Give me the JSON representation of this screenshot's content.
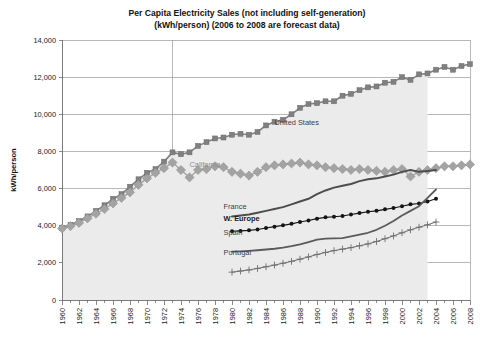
{
  "chart_data": {
    "type": "line",
    "title": "Per Capita Electricity Sales (not including self-generation)",
    "subtitle": "(kWh/person) (2006 to 2008 are forecast data)",
    "xlabel": "",
    "ylabel": "kWh/person",
    "ylim": [
      0,
      14000
    ],
    "ytick_step": 2000,
    "ytick_labels": [
      "0",
      "2,000",
      "4,000",
      "6,000",
      "8,000",
      "10,000",
      "12,000",
      "14,000"
    ],
    "ytick_values": [
      0,
      2000,
      4000,
      6000,
      8000,
      10000,
      12000,
      14000
    ],
    "xlim": [
      1960,
      2008
    ],
    "xtick_labels": [
      "1960",
      "1962",
      "1964",
      "1966",
      "1968",
      "1970",
      "1972",
      "1974",
      "1976",
      "1978",
      "1980",
      "1982",
      "1984",
      "1986",
      "1988",
      "1990",
      "1992",
      "1994",
      "1996",
      "1998",
      "2000",
      "2002",
      "2004",
      "2006",
      "2008"
    ],
    "xtick_values": [
      1960,
      1962,
      1964,
      1966,
      1968,
      1970,
      1972,
      1974,
      1976,
      1978,
      1980,
      1982,
      1984,
      1986,
      1988,
      1990,
      1992,
      1994,
      1996,
      1998,
      2000,
      2002,
      2004,
      2006,
      2008
    ],
    "xtick_minor_step": 1,
    "grid": "horizontal-major-plus-1973-vertical",
    "legend": "inline-labels-on-plot",
    "forecast_note": "2006 to 2008 are forecast data",
    "series": [
      {
        "name": "United States",
        "label": "United States",
        "color": "#808080",
        "marker": "square",
        "marker_size": 5,
        "line_width": 1.6,
        "fill": "#ebebeb",
        "fill_end_year": 2003,
        "label_x": 1985,
        "label_y": 9450,
        "label_style": "normal",
        "x": [
          1960,
          1961,
          1962,
          1963,
          1964,
          1965,
          1966,
          1967,
          1968,
          1969,
          1970,
          1971,
          1972,
          1973,
          1974,
          1975,
          1976,
          1977,
          1978,
          1979,
          1980,
          1981,
          1982,
          1983,
          1984,
          1985,
          1986,
          1987,
          1988,
          1989,
          1990,
          1991,
          1992,
          1993,
          1994,
          1995,
          1996,
          1997,
          1998,
          1999,
          2000,
          2001,
          2002,
          2003,
          2004,
          2005,
          2006,
          2007,
          2008
        ],
        "y": [
          3880,
          4050,
          4250,
          4500,
          4800,
          5100,
          5450,
          5700,
          6100,
          6500,
          6850,
          7050,
          7450,
          7950,
          7850,
          7950,
          8300,
          8500,
          8700,
          8750,
          8900,
          8950,
          8900,
          9050,
          9400,
          9600,
          9700,
          10000,
          10350,
          10550,
          10600,
          10700,
          10700,
          11000,
          11100,
          11300,
          11450,
          11500,
          11700,
          11750,
          12000,
          11850,
          12150,
          12200,
          12400,
          12550,
          12400,
          12600,
          12700
        ]
      },
      {
        "name": "California",
        "label": "California",
        "color": "#a3a3a3",
        "marker": "diamond",
        "marker_size": 4.6,
        "line_width": 1.4,
        "label_x": 1975,
        "label_y": 7150,
        "label_style": "light",
        "x": [
          1960,
          1961,
          1962,
          1963,
          1964,
          1965,
          1966,
          1967,
          1968,
          1969,
          1970,
          1971,
          1972,
          1973,
          1974,
          1975,
          1976,
          1977,
          1978,
          1979,
          1980,
          1981,
          1982,
          1983,
          1984,
          1985,
          1986,
          1987,
          1988,
          1989,
          1990,
          1991,
          1992,
          1993,
          1994,
          1995,
          1996,
          1997,
          1998,
          1999,
          2000,
          2001,
          2002,
          2003,
          2004,
          2005,
          2006,
          2007,
          2008
        ],
        "y": [
          3850,
          3980,
          4150,
          4400,
          4650,
          4900,
          5200,
          5500,
          5800,
          6200,
          6550,
          6850,
          7100,
          7400,
          7000,
          6600,
          7000,
          7050,
          7200,
          7150,
          6900,
          6800,
          6700,
          6900,
          7150,
          7250,
          7300,
          7350,
          7400,
          7300,
          7250,
          7150,
          7100,
          7050,
          7000,
          7050,
          7000,
          6950,
          6900,
          7000,
          7050,
          6650,
          6900,
          7000,
          7100,
          7200,
          7200,
          7250,
          7300
        ]
      },
      {
        "name": "France",
        "label": "France",
        "color": "#4d4d4d",
        "marker": "none",
        "marker_size": 0,
        "line_width": 2.0,
        "label_x": 1979,
        "label_y": 4900,
        "label_style": "normal",
        "x": [
          1980,
          1981,
          1982,
          1983,
          1984,
          1985,
          1986,
          1987,
          1988,
          1989,
          1990,
          1991,
          1992,
          1993,
          1994,
          1995,
          1996,
          1997,
          1998,
          1999,
          2000,
          2001,
          2002,
          2003,
          2004
        ],
        "y": [
          4500,
          4550,
          4600,
          4700,
          4800,
          4900,
          5000,
          5150,
          5300,
          5450,
          5700,
          5900,
          6050,
          6150,
          6250,
          6400,
          6500,
          6550,
          6650,
          6750,
          6900,
          7000,
          6900,
          6950,
          7000
        ]
      },
      {
        "name": "W. Europe",
        "label": "W. Europe",
        "color": "#141414",
        "marker": "circle",
        "marker_size": 3.0,
        "line_width": 1.1,
        "label_x": 1979,
        "label_y": 4250,
        "label_style": "bold",
        "x": [
          1980,
          1981,
          1982,
          1983,
          1984,
          1985,
          1986,
          1987,
          1988,
          1989,
          1990,
          1991,
          1992,
          1993,
          1994,
          1995,
          1996,
          1997,
          1998,
          1999,
          2000,
          2001,
          2002,
          2003,
          2004
        ],
        "y": [
          3700,
          3720,
          3750,
          3800,
          3880,
          3950,
          4020,
          4100,
          4200,
          4280,
          4380,
          4450,
          4480,
          4520,
          4600,
          4680,
          4750,
          4800,
          4880,
          4950,
          5050,
          5150,
          5200,
          5300,
          5450
        ]
      },
      {
        "name": "Spain",
        "label": "Spain",
        "color": "#5a5a5a",
        "marker": "none",
        "marker_size": 0,
        "line_width": 1.8,
        "label_x": 1979,
        "label_y": 3500,
        "label_style": "normal",
        "x": [
          1980,
          1981,
          1982,
          1983,
          1984,
          1985,
          1986,
          1987,
          1988,
          1989,
          1990,
          1991,
          1992,
          1993,
          1994,
          1995,
          1996,
          1997,
          1998,
          1999,
          2000,
          2001,
          2002,
          2003,
          2004
        ],
        "y": [
          2600,
          2620,
          2650,
          2680,
          2720,
          2760,
          2820,
          2900,
          3000,
          3120,
          3250,
          3300,
          3320,
          3330,
          3420,
          3520,
          3620,
          3780,
          4000,
          4250,
          4550,
          4800,
          5050,
          5500,
          5950
        ]
      },
      {
        "name": "Portugal",
        "label": "Portugal",
        "color": "#6e6e6e",
        "marker": "plus",
        "marker_size": 3.4,
        "line_width": 1.0,
        "label_x": 1979,
        "label_y": 2400,
        "label_style": "normal",
        "x": [
          1980,
          1981,
          1982,
          1983,
          1984,
          1985,
          1986,
          1987,
          1988,
          1989,
          1990,
          1991,
          1992,
          1993,
          1994,
          1995,
          1996,
          1997,
          1998,
          1999,
          2000,
          2001,
          2002,
          2003,
          2004
        ],
        "y": [
          1500,
          1560,
          1620,
          1700,
          1790,
          1880,
          1980,
          2080,
          2200,
          2320,
          2450,
          2560,
          2660,
          2740,
          2820,
          2920,
          3020,
          3150,
          3300,
          3450,
          3620,
          3780,
          3920,
          4050,
          4200
        ]
      }
    ]
  }
}
